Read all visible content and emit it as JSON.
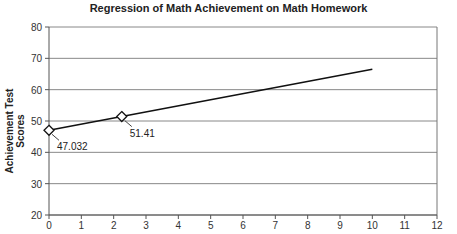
{
  "chart_data": {
    "type": "line",
    "title": "Regression of Math Achievement on Math Homework",
    "xlabel": "",
    "ylabel": "Achievement Test Scores",
    "xlim": [
      0,
      12
    ],
    "ylim": [
      20,
      80
    ],
    "x_ticks": [
      0,
      1,
      2,
      3,
      4,
      5,
      6,
      7,
      8,
      9,
      10,
      11,
      12
    ],
    "y_ticks": [
      20,
      30,
      40,
      50,
      60,
      70,
      80
    ],
    "grid": "horizontal",
    "series": [
      {
        "name": "Regression line",
        "x": [
          0,
          2.25,
          10
        ],
        "values": [
          47.032,
          51.41,
          66.5
        ]
      }
    ],
    "markers": [
      {
        "x": 0,
        "y": 47.032,
        "label": "47.032"
      },
      {
        "x": 2.25,
        "y": 51.41,
        "label": "51.41"
      }
    ]
  }
}
